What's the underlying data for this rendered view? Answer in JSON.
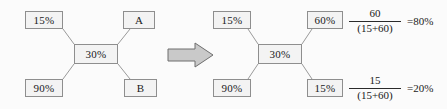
{
  "figure": {
    "colors": {
      "background": "#fbfbfb",
      "box_fill": "#f3f3f3",
      "box_border": "#8e8e8e",
      "edge_line": "#9a9a9a",
      "arrow_fill": "#c9c9c9",
      "arrow_border": "#6e6e6e",
      "text": "#1a1a1a"
    },
    "arrow_label": "transforms-to"
  },
  "left_diagram": {
    "name": "before-normalization",
    "center": {
      "label": "30%"
    },
    "nodes": [
      {
        "id": "top-left",
        "label": "15%"
      },
      {
        "id": "top-right",
        "label": "A"
      },
      {
        "id": "bottom-left",
        "label": "90%"
      },
      {
        "id": "bottom-right",
        "label": "B"
      }
    ]
  },
  "right_diagram": {
    "name": "after-normalization",
    "center": {
      "label": "30%"
    },
    "nodes": [
      {
        "id": "top-left",
        "label": "15%"
      },
      {
        "id": "top-right",
        "label": "60%"
      },
      {
        "id": "bottom-left",
        "label": "90%"
      },
      {
        "id": "bottom-right",
        "label": "15%"
      }
    ]
  },
  "calculations": [
    {
      "id": "top-calc",
      "numerator": "60",
      "denominator": "(15+60)",
      "result": "=80%"
    },
    {
      "id": "bottom-calc",
      "numerator": "15",
      "denominator": "(15+60)",
      "result": "=20%"
    }
  ]
}
